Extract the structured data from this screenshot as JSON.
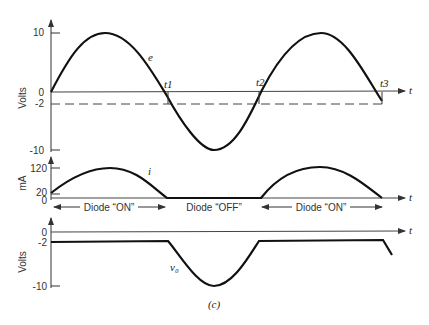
{
  "figure": {
    "caption": "(c)",
    "top_plot": {
      "ylabel": "Volts",
      "ticks": [
        "10",
        "0",
        "-2",
        "-10"
      ],
      "curve_label": "e",
      "time_label": "t",
      "markers": [
        "t1",
        "t2",
        "t3"
      ]
    },
    "middle_plot": {
      "ylabel": "mA",
      "ticks": [
        "120",
        "20",
        "0"
      ],
      "curve_label": "i",
      "time_label": "t",
      "regions": [
        "Diode “ON”",
        "Diode “OFF”",
        "Diode “ON”"
      ]
    },
    "bottom_plot": {
      "ylabel": "Volts",
      "ticks": [
        "0",
        "-2",
        "-10"
      ],
      "curve_label": "v₀",
      "time_label": "t"
    }
  }
}
